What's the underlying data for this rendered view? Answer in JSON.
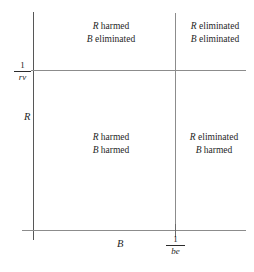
{
  "figure": {
    "type": "phase-diagram"
  },
  "axes": {
    "y": {
      "name": "R",
      "threshold": {
        "numerator": "1",
        "denominator": "rv"
      }
    },
    "x": {
      "name": "B",
      "threshold": {
        "numerator": "1",
        "denominator": "be"
      }
    }
  },
  "quadrants": {
    "top_left": {
      "line1": "R harmed",
      "line2": "B eliminated",
      "r_symbol": "R",
      "r_state": "harmed",
      "b_symbol": "B",
      "b_state": "eliminated"
    },
    "top_right": {
      "line1": "R eliminated",
      "line2": "B eliminated",
      "r_symbol": "R",
      "r_state": "eliminated",
      "b_symbol": "B",
      "b_state": "eliminated"
    },
    "bottom_left": {
      "line1": "R harmed",
      "line2": "B harmed",
      "r_symbol": "R",
      "r_state": "harmed",
      "b_symbol": "B",
      "b_state": "harmed"
    },
    "bottom_right": {
      "line1": "R eliminated",
      "line2": "B harmed",
      "r_symbol": "R",
      "r_state": "eliminated",
      "b_symbol": "B",
      "b_state": "harmed"
    }
  },
  "colors": {
    "background": "#ffffff",
    "axis": "#575757",
    "gridline": "#8c8c8c",
    "text": "#1f1f1f"
  },
  "chart_data": {
    "type": "table",
    "title": "",
    "xlabel": "B",
    "ylabel": "R",
    "x_threshold_label": "1/be",
    "y_threshold_label": "1/rv",
    "grid": true,
    "legend": "none",
    "categories": [
      "B < 1/be",
      "B > 1/be"
    ],
    "row_categories": [
      "R > 1/rv",
      "R < 1/rv"
    ],
    "cells": [
      [
        "R harmed / B eliminated",
        "R eliminated / B eliminated"
      ],
      [
        "R harmed / B harmed",
        "R eliminated / B harmed"
      ]
    ]
  }
}
